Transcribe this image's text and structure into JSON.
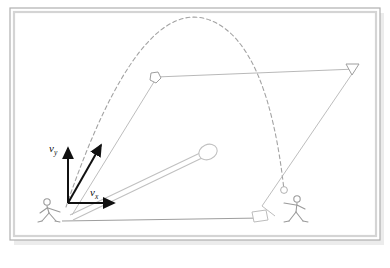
{
  "figure": {
    "frame": {
      "border_color": "#b3b3b3",
      "inner_color": "#d8d8d8",
      "shadow_color": "#e8e8e8",
      "background": "#ffffff",
      "x": 10,
      "y": 8,
      "width": 370,
      "height": 232
    },
    "labels": {
      "v_vertical": "v",
      "v_vertical_sub": "y",
      "v_horizontal": "v",
      "v_horizontal_sub": "x"
    },
    "vectors": {
      "color": "#111111",
      "origin_x": 68,
      "origin_y": 203,
      "vertical": {
        "name": "vertical-velocity-vector",
        "tip_x": 68,
        "tip_y": 146
      },
      "horizontal": {
        "name": "horizontal-velocity-vector",
        "tip_x": 117,
        "tip_y": 203
      },
      "resultant": {
        "name": "resultant-velocity-vector",
        "tip_x": 103,
        "tip_y": 142
      }
    },
    "trajectory": {
      "name": "dashed-parabolic-trajectory",
      "color": "#9a9a9a",
      "dash": "4 3",
      "start_x": 66,
      "start_y": 207,
      "apex_x": 212,
      "apex_y": 21,
      "end_x": 284,
      "end_y": 190
    },
    "implement": {
      "name": "cue-stick-with-knob",
      "color": "#bdbdbd",
      "shaft_start_x": 72,
      "shaft_start_y": 214,
      "shaft_end_x": 200,
      "shaft_end_y": 156,
      "knob_cx": 208,
      "knob_cy": 152,
      "knob_rx": 9,
      "knob_ry": 7
    },
    "ghost_positions": [
      {
        "name": "ghost-position-launch",
        "marker": "pentagon",
        "x": 155,
        "y": 78
      },
      {
        "name": "ghost-position-apex-line-end",
        "marker": "triangle",
        "x": 353,
        "y": 68
      },
      {
        "name": "ghost-position-landing",
        "marker": "circle",
        "x": 284,
        "y": 190
      }
    ],
    "guide_lines": [
      {
        "name": "horizontal-reference-line",
        "x1": 155,
        "y1": 77,
        "x2": 356,
        "y2": 69
      },
      {
        "name": "launch-diagonal-line",
        "x1": 72,
        "y1": 214,
        "x2": 158,
        "y2": 76
      },
      {
        "name": "landing-diagonal-line",
        "x1": 262,
        "y1": 205,
        "x2": 355,
        "y2": 70
      }
    ],
    "ground_line": {
      "name": "ground-baseline",
      "x1": 62,
      "y1": 220,
      "x2": 258,
      "y2": 218
    },
    "figures": [
      {
        "name": "thrower-figure-left",
        "x": 40,
        "y": 198,
        "facing": "right"
      },
      {
        "name": "catcher-figure-right",
        "x": 285,
        "y": 196,
        "facing": "left"
      }
    ]
  }
}
